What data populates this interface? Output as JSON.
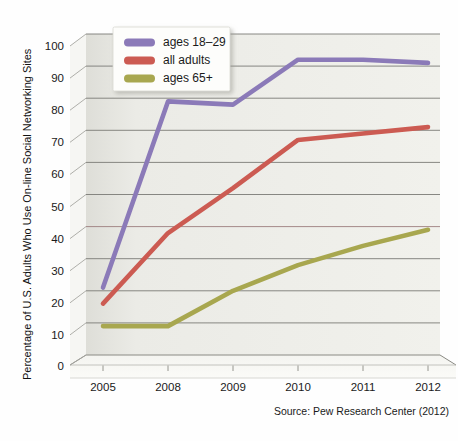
{
  "chart_data": {
    "type": "line",
    "title": "",
    "xlabel": "",
    "ylabel": "Percentage of U.S. Adults Who Use On-line Social Networking Sites",
    "categories": [
      "2005",
      "2008",
      "2009",
      "2010",
      "2011",
      "2012"
    ],
    "x": [
      2005,
      2008,
      2009,
      2010,
      2011,
      2012
    ],
    "ylim": [
      0,
      100
    ],
    "yticks": [
      "0",
      "10",
      "20",
      "30",
      "40",
      "50",
      "60",
      "70",
      "80",
      "90",
      "100"
    ],
    "ytick_values": [
      0,
      10,
      20,
      30,
      40,
      50,
      60,
      70,
      80,
      90,
      100
    ],
    "grid": true,
    "legend_position": "top-left",
    "series": [
      {
        "name": "ages 18–29",
        "color": "#8b7ab8",
        "values": [
          21,
          79,
          78,
          92,
          92,
          91
        ]
      },
      {
        "name": "all adults",
        "color": "#cc5b52",
        "values": [
          16,
          38,
          52,
          67,
          69,
          71
        ]
      },
      {
        "name": "ages 65+",
        "color": "#a8a74f",
        "values": [
          9,
          9,
          20,
          28,
          34,
          39
        ]
      }
    ],
    "annotations": [
      "Source: Pew Research Center (2012)"
    ]
  },
  "legend": {
    "items": [
      {
        "label": "ages 18–29",
        "color": "#8b7ab8"
      },
      {
        "label": "all adults",
        "color": "#cc5b52"
      },
      {
        "label": "ages 65+",
        "color": "#a8a74f"
      }
    ]
  },
  "yaxis": {
    "title": "Percentage of U.S. Adults Who Use On-line Social Networking Sites",
    "ticks": [
      "100",
      "90",
      "80",
      "70",
      "60",
      "50",
      "40",
      "30",
      "20",
      "10",
      "0"
    ]
  },
  "xaxis": {
    "ticks": [
      "2005",
      "2008",
      "2009",
      "2010",
      "2011",
      "2012"
    ]
  },
  "footer": {
    "source": "Source: Pew Research Center (2012)"
  },
  "colors": {
    "wall": "#e9e9e4",
    "floor": "#f3f3ef",
    "gridline": "#767676",
    "text": "#1a1a1a",
    "legend_background": "#fdfdfb"
  }
}
